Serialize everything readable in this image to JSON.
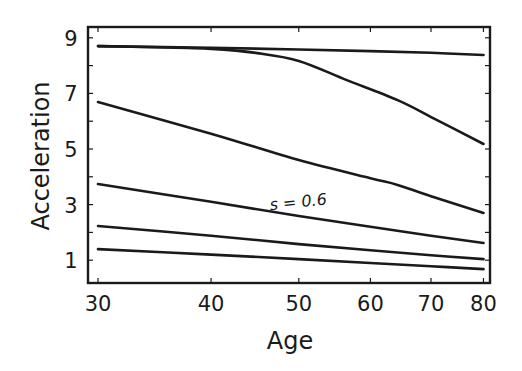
{
  "chart_data": {
    "type": "line",
    "title": "",
    "xlabel": "Age",
    "ylabel": "Acceleration",
    "xscale": "log",
    "xlim": [
      30,
      80
    ],
    "ylim": [
      0.2,
      9.4
    ],
    "xticks": [
      30,
      40,
      50,
      60,
      70,
      80
    ],
    "yticks": [
      1,
      3,
      5,
      7,
      9
    ],
    "grid": false,
    "legend": null,
    "annotations": [
      {
        "text": "s = 0.6",
        "x": 50,
        "y": 2.9,
        "series_index": 3,
        "rotation": -6
      }
    ],
    "series": [
      {
        "name": "curve-1",
        "x": [
          30,
          40,
          50,
          60,
          70,
          80
        ],
        "values": [
          8.7,
          8.64,
          8.58,
          8.52,
          8.46,
          8.38
        ]
      },
      {
        "name": "curve-2",
        "x": [
          30,
          35,
          40,
          45,
          50,
          56.5,
          64.3,
          71.1,
          80
        ],
        "values": [
          8.7,
          8.66,
          8.6,
          8.45,
          8.17,
          7.48,
          6.76,
          6.04,
          5.18
        ]
      },
      {
        "name": "curve-3",
        "x": [
          30,
          40,
          50,
          60,
          64.3,
          70,
          80
        ],
        "values": [
          6.69,
          5.55,
          4.6,
          3.95,
          3.71,
          3.3,
          2.7
        ]
      },
      {
        "name": "curve-4",
        "x": [
          30,
          40,
          50,
          60,
          70,
          80
        ],
        "values": [
          3.74,
          3.1,
          2.59,
          2.2,
          1.88,
          1.62
        ]
      },
      {
        "name": "curve-5",
        "x": [
          30,
          40,
          50,
          60,
          70,
          80
        ],
        "values": [
          2.23,
          1.88,
          1.58,
          1.36,
          1.18,
          1.04
        ]
      },
      {
        "name": "curve-6",
        "x": [
          30,
          40,
          50,
          60,
          70,
          80
        ],
        "values": [
          1.4,
          1.2,
          1.04,
          0.9,
          0.78,
          0.68
        ]
      }
    ]
  }
}
